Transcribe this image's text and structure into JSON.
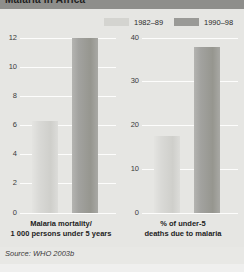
{
  "figure": {
    "title": "Malaria in Africa",
    "source": "Source: WHO 2003b"
  },
  "legend": {
    "items": [
      {
        "label": "1982–89",
        "color": "#d4d4d0",
        "swatch_name": "legend-swatch-1982-89"
      },
      {
        "label": "1990–98",
        "color": "#9a9a97",
        "swatch_name": "legend-swatch-1990-98"
      }
    ]
  },
  "chart_data": [
    {
      "type": "bar",
      "panel": "left",
      "title": "",
      "categories": [
        "1982–89",
        "1990–98"
      ],
      "values": [
        6.3,
        12.0
      ],
      "series": [
        {
          "name": "1982–89",
          "values": [
            6.3
          ]
        },
        {
          "name": "1990–98",
          "values": [
            12.0
          ]
        }
      ],
      "xlabel_lines": [
        "Malaria mortality/",
        "1 000 persons under 5 years"
      ],
      "ylabel": "",
      "ylim": [
        0,
        12
      ],
      "yticks": [
        0,
        2,
        4,
        6,
        8,
        10,
        12
      ],
      "ytick_labels": [
        "0",
        "2",
        "4",
        "6",
        "8",
        "10",
        "12"
      ],
      "grid": true,
      "legend_position": "top"
    },
    {
      "type": "bar",
      "panel": "right",
      "title": "",
      "categories": [
        "1982–89",
        "1990–98"
      ],
      "values": [
        17.5,
        38.0
      ],
      "series": [
        {
          "name": "1982–89",
          "values": [
            17.5
          ]
        },
        {
          "name": "1990–98",
          "values": [
            38.0
          ]
        }
      ],
      "xlabel_lines": [
        "% of under-5",
        "deaths due to malaria"
      ],
      "ylabel": "",
      "ylim": [
        0,
        40
      ],
      "yticks": [
        0,
        10,
        20,
        30,
        40
      ],
      "ytick_labels": [
        "0",
        "10",
        "20",
        "30",
        "40"
      ],
      "grid": true,
      "legend_position": "top"
    }
  ]
}
